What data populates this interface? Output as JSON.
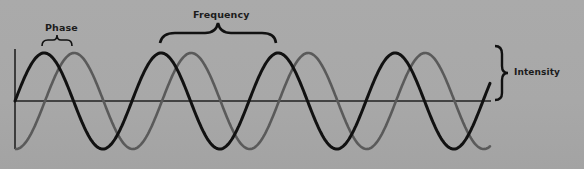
{
  "diagram": {
    "labels": {
      "phase": "Phase",
      "frequency": "Frequency",
      "intensity": "Intensity"
    },
    "colors": {
      "background": "#a9a9a9",
      "wave_primary": "#111111",
      "wave_secondary": "#5a5a5a",
      "axis": "#222222",
      "brace": "#111111"
    },
    "waves": [
      {
        "name": "reference-wave",
        "color": "#111111",
        "phase_offset_px": 0,
        "wavelength_px": 117,
        "amplitude_px": 48,
        "start": "zero-rising"
      },
      {
        "name": "shifted-wave",
        "color": "#5a5a5a",
        "phase_offset_px": 30,
        "wavelength_px": 117,
        "amplitude_px": 48,
        "start": "trough"
      }
    ],
    "axes": {
      "origin": [
        15,
        101
      ],
      "x_end": 490,
      "y_top": 50,
      "y_bottom": 148
    }
  }
}
